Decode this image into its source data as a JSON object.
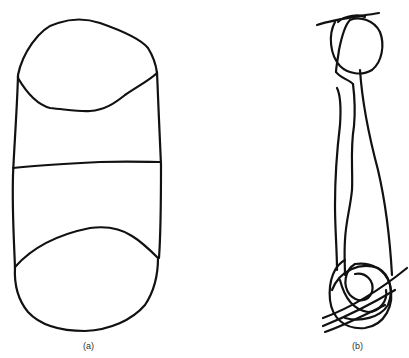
{
  "figure": {
    "panels": [
      {
        "id": "a",
        "label": "(a)",
        "description": "Capsule-like outline: top ellipse, vertical sides, horizontal middle line, bottom ellipse"
      },
      {
        "id": "b",
        "label": "(b)",
        "description": "Scribbled figure: circle at top with crossing line, long narrow vertical strokes, tangled loops at bottom with diagonal lines"
      }
    ],
    "stroke_color": "#111111",
    "background": "#ffffff"
  }
}
